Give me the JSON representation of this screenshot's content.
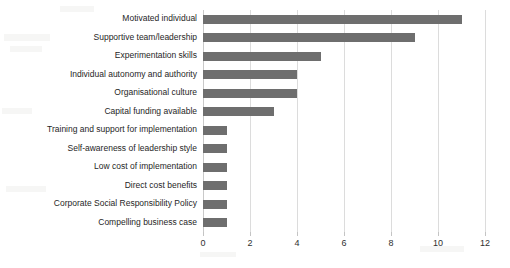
{
  "chart_data": {
    "type": "bar",
    "orientation": "horizontal",
    "title": "",
    "xlabel": "",
    "ylabel": "",
    "xlim": [
      0,
      12
    ],
    "xticks": [
      0,
      2,
      4,
      6,
      8,
      10,
      12
    ],
    "xtick_labels": [
      "0",
      "2",
      "4",
      "6",
      "8",
      "10",
      "12"
    ],
    "grid": "vertical-only",
    "legend": "none",
    "bar_color": "#6e6e6e",
    "gridline_color": "#dcdcdc",
    "text_color": "#262626",
    "categories": [
      "Motivated individual",
      "Supportive team/leadership",
      "Experimentation skills",
      "Individual autonomy and authority",
      "Organisational culture",
      "Capital funding available",
      "Training and support for implementation",
      "Self-awareness of leadership style",
      "Low cost of implementation",
      "Direct cost benefits",
      "Corporate Social Responsibility Policy",
      "Compelling business case"
    ],
    "values": [
      11,
      9,
      5,
      4,
      4,
      3,
      1,
      1,
      1,
      1,
      1,
      1
    ]
  }
}
